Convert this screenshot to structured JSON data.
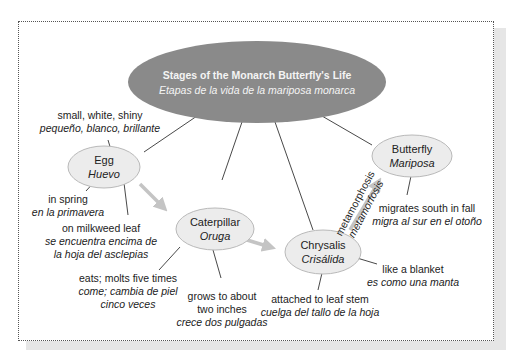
{
  "diagram": {
    "type": "concept-map",
    "title": {
      "en": "Stages of the Monarch Butterfly's Life",
      "es": "Etapas de la vida de la mariposa monarca"
    },
    "nodes": [
      {
        "id": "egg",
        "en": "Egg",
        "es": "Huevo"
      },
      {
        "id": "caterpillar",
        "en": "Caterpillar",
        "es": "Oruga"
      },
      {
        "id": "chrysalis",
        "en": "Chrysalis",
        "es": "Crisálida"
      },
      {
        "id": "butterfly",
        "en": "Butterfly",
        "es": "Mariposa"
      }
    ],
    "details": {
      "egg_1": {
        "en": "small, white, shiny",
        "es": "pequeño, blanco, brillante"
      },
      "egg_2": {
        "en": "in spring",
        "es": "en la primavera"
      },
      "egg_3": {
        "en": "on milkweed leaf",
        "es1": "se encuentra encima de",
        "es2": "la hoja del asclepias"
      },
      "cat_1": {
        "en": "eats; molts five times",
        "es1": "come; cambia de piel",
        "es2": "cinco veces"
      },
      "cat_2": {
        "en1": "grows to about",
        "en2": "two inches",
        "es": "crece dos pulgadas"
      },
      "chr_1": {
        "en": "attached to leaf stem",
        "es": "cuelga del tallo de la hoja"
      },
      "chr_2": {
        "en": "like a blanket",
        "es": "es como una manta"
      },
      "but_1": {
        "en": "migrates south in fall",
        "es": "migra al sur en el otoño"
      }
    },
    "arrow_label": {
      "en": "metamorphosis",
      "es": "metamorfosis"
    },
    "colors": {
      "title_ellipse": "#8a8a8a",
      "node_fill": "#ececec",
      "node_border": "#b9b9b9",
      "arrow": "#c4c4c4",
      "line": "#333333"
    }
  }
}
